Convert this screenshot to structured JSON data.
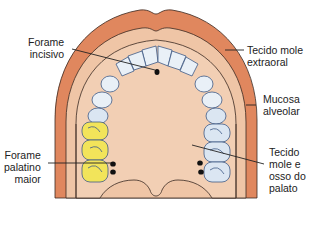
{
  "diagram": {
    "title": "",
    "colors": {
      "outer_tissue": "#e0875e",
      "alveolar_mucosa": "#efc5a6",
      "palate": "#f2cfb4",
      "tooth_fill": "#e9f0f7",
      "tooth_outline": "#3f5a86",
      "molar_highlight": "#f2e45a",
      "outline": "#3a2a22",
      "leader_line": "#222222",
      "foramen": "#111111"
    },
    "labels": {
      "forame_incisivo": [
        "Forame",
        "incisivo"
      ],
      "tecido_mole_extraoral": [
        "Tecido mole",
        "extraoral"
      ],
      "mucosa_alveolar": [
        "Mucosa",
        "alveolar"
      ],
      "forame_palatino_maior": [
        "Forame",
        "palatino",
        "maior"
      ],
      "tecido_mole_osso_palato": [
        "Tecido",
        "mole e",
        "osso do",
        "palato"
      ]
    }
  }
}
